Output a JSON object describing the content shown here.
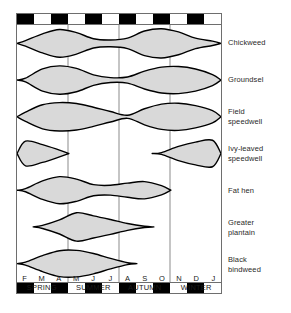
{
  "chart_data": {
    "type": "area",
    "title": "",
    "xlabel": "",
    "ylabel": "",
    "grid": "season dividers only",
    "legend": "right-side species labels",
    "x": [
      "F",
      "M",
      "A",
      "M",
      "J",
      "J",
      "A",
      "S",
      "O",
      "N",
      "D",
      "J"
    ],
    "x_months_full": [
      "February",
      "March",
      "April",
      "May",
      "June",
      "July",
      "August",
      "September",
      "October",
      "November",
      "December",
      "January"
    ],
    "seasons": [
      {
        "name": "SPRING",
        "months": [
          "F",
          "M",
          "A"
        ]
      },
      {
        "name": "SUMMER",
        "months": [
          "M",
          "J",
          "J"
        ]
      },
      {
        "name": "AUTUMN",
        "months": [
          "A",
          "S",
          "O"
        ]
      },
      {
        "name": "WINTER",
        "months": [
          "N",
          "D",
          "J"
        ]
      }
    ],
    "month_bar_pattern": [
      "dark",
      "light",
      "dark",
      "light",
      "dark",
      "light",
      "dark",
      "light",
      "dark",
      "light",
      "dark",
      "light"
    ],
    "series": [
      {
        "name": "Chickweed",
        "values": [
          0.18,
          0.62,
          0.9,
          0.7,
          0.3,
          0.22,
          0.34,
          0.8,
          0.95,
          0.74,
          0.34,
          0.14
        ]
      },
      {
        "name": "Groundsel",
        "values": [
          0.12,
          0.72,
          0.92,
          0.76,
          0.34,
          0.16,
          0.2,
          0.58,
          0.84,
          0.88,
          0.72,
          0.36
        ]
      },
      {
        "name": "Field speedwell",
        "values": [
          0.3,
          0.78,
          0.92,
          0.86,
          0.62,
          0.34,
          0.1,
          0.52,
          0.82,
          0.88,
          0.72,
          0.4
        ]
      },
      {
        "name": "Ivy-leaved speedwell",
        "values": [
          0.8,
          0.58,
          0.22,
          0.0,
          0.0,
          0.0,
          0.0,
          0.0,
          0.06,
          0.46,
          0.74,
          0.86
        ]
      },
      {
        "name": "Fat hen",
        "values": [
          0.1,
          0.6,
          0.88,
          0.72,
          0.36,
          0.32,
          0.46,
          0.56,
          0.3,
          0.0,
          0.0,
          0.0
        ]
      },
      {
        "name": "Greater plantain",
        "values": [
          0.0,
          0.1,
          0.46,
          0.92,
          0.72,
          0.48,
          0.22,
          0.04,
          0.0,
          0.0,
          0.0,
          0.0
        ]
      },
      {
        "name": "Black bindweed",
        "values": [
          0.1,
          0.52,
          0.84,
          0.86,
          0.66,
          0.34,
          0.06,
          0.0,
          0.0,
          0.0,
          0.0,
          0.0
        ]
      }
    ],
    "colors": {
      "fill": "#d9d9d9",
      "outline": "#000000",
      "frame": "#6e6e6e",
      "divider": "#8a8a8a",
      "month_dark": "#000000",
      "month_light": "#ffffff"
    }
  },
  "species_labels": [
    {
      "lines": [
        "Chickweed"
      ]
    },
    {
      "lines": [
        "Groundsel"
      ]
    },
    {
      "lines": [
        "Field",
        "speedwell"
      ]
    },
    {
      "lines": [
        "Ivy-leaved",
        "speedwell"
      ]
    },
    {
      "lines": [
        "Fat hen"
      ]
    },
    {
      "lines": [
        "Greater",
        "plantain"
      ]
    },
    {
      "lines": [
        "Black",
        "bindweed"
      ]
    }
  ],
  "axis": {
    "months": [
      "F",
      "M",
      "A",
      "M",
      "J",
      "J",
      "A",
      "S",
      "O",
      "N",
      "D",
      "J"
    ],
    "seasons": [
      "SPRING",
      "SUMMER",
      "AUTUMN",
      "WINTER"
    ]
  }
}
